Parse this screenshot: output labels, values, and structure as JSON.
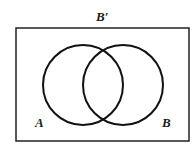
{
  "diagram": {
    "type": "venn",
    "universe_label": "B′",
    "sets": [
      {
        "label": "A",
        "cx": 83,
        "cy": 85,
        "r": 40
      },
      {
        "label": "B",
        "cx": 123,
        "cy": 85,
        "r": 40
      }
    ],
    "stroke_color": "#111111",
    "background": "#ffffff"
  }
}
